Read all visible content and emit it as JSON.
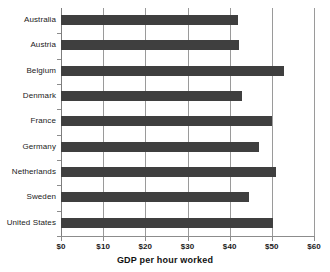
{
  "chart_data": {
    "type": "bar",
    "orientation": "horizontal",
    "title": "",
    "xlabel": "GDP per hour worked",
    "ylabel": "",
    "xlim": [
      0,
      60
    ],
    "xticks": [
      0,
      10,
      20,
      30,
      40,
      50,
      60
    ],
    "xtick_labels": [
      "$0",
      "$10",
      "$20",
      "$30",
      "$40",
      "$50",
      "$60"
    ],
    "grid": true,
    "legend": false,
    "bar_color": "#3f3f3f",
    "categories": [
      "Australia",
      "Austria",
      "Belgium",
      "Denmark",
      "France",
      "Germany",
      "Netherlands",
      "Sweden",
      "United States"
    ],
    "values": [
      42.0,
      42.3,
      53.0,
      43.0,
      50.0,
      47.0,
      51.0,
      44.5,
      50.2
    ]
  }
}
